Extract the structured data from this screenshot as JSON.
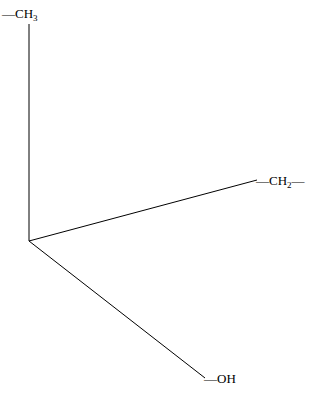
{
  "diagram": {
    "type": "molecular-skeleton",
    "groups": [
      {
        "id": "methyl",
        "text": "CH",
        "sub": "3",
        "prefix": "—",
        "suffix": ""
      },
      {
        "id": "methylene",
        "text": "CH",
        "sub": "2",
        "prefix": "—",
        "suffix": "—"
      },
      {
        "id": "hydroxyl",
        "text": "OH",
        "sub": "",
        "prefix": "—",
        "suffix": ""
      }
    ],
    "line_color": "#000000"
  }
}
